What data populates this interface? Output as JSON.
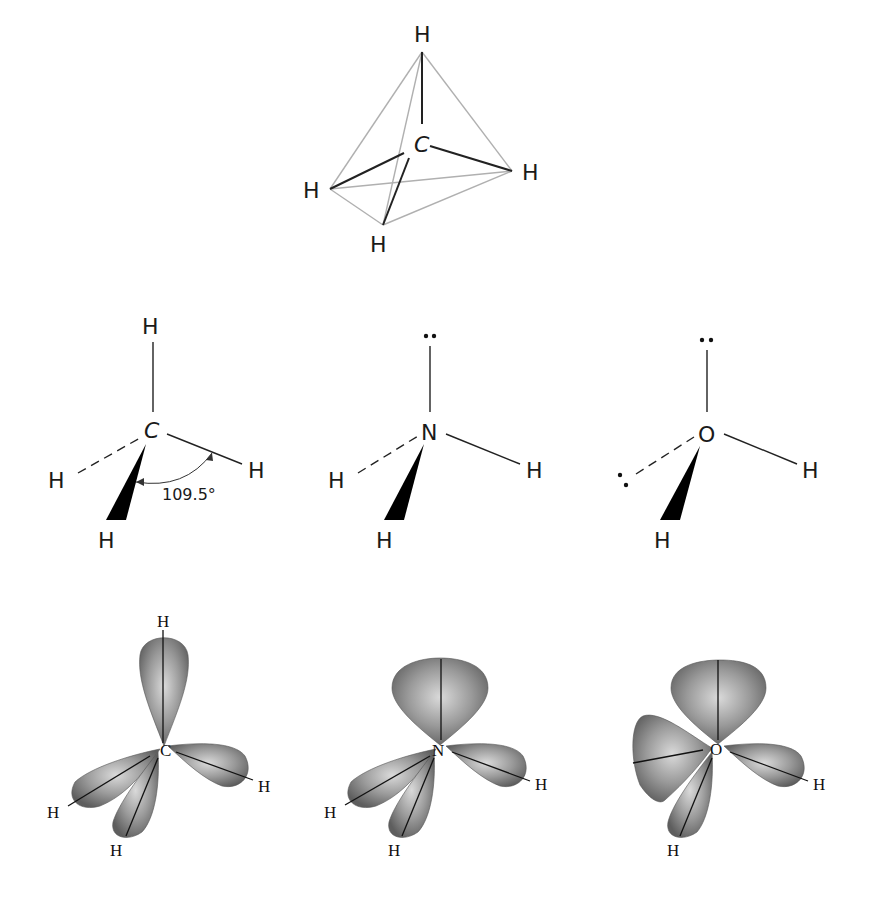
{
  "figure": {
    "tetrahedron": {
      "center": "C",
      "top": "H",
      "left": "H",
      "right": "H",
      "bottom": "H"
    },
    "structures": [
      {
        "molecule": "methane",
        "center": "C",
        "top": "H",
        "dashed": "H",
        "right": "H",
        "wedge": "H",
        "angle_label": "109.5°"
      },
      {
        "molecule": "ammonia",
        "center": "N",
        "top": "••",
        "dashed": "H",
        "right": "H",
        "wedge": "H"
      },
      {
        "molecule": "water",
        "center": "O",
        "top": "••",
        "dashed": ":",
        "right": "H",
        "wedge": "H"
      }
    ],
    "orbitals": [
      {
        "molecule": "methane",
        "center": "C",
        "top": "H",
        "left": "H",
        "bottom": "H",
        "right": "H"
      },
      {
        "molecule": "ammonia",
        "center": "N",
        "left": "H",
        "bottom": "H",
        "right": "H"
      },
      {
        "molecule": "water",
        "center": "O",
        "bottom": "H",
        "right": "H"
      }
    ]
  },
  "colors": {
    "lobe_light": "#d8d8d8",
    "lobe_dark": "#6a6a6a",
    "edge": "#b0b0b0"
  }
}
